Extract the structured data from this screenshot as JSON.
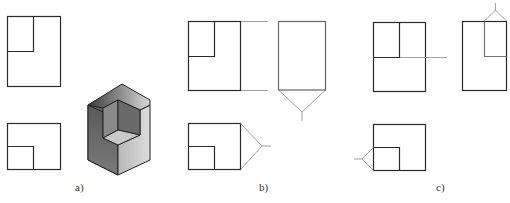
{
  "figure": {
    "panels": [
      {
        "label": "a)",
        "content": "front view, top view, isometric solid with corner notch"
      },
      {
        "label": "b)",
        "content": "front view, top view, derived side view with 45-degree construction lines"
      },
      {
        "label": "c)",
        "content": "projection of notch feature to side view"
      }
    ]
  },
  "colors": {
    "line": "#2a2a2a",
    "construction": "#888888",
    "solid_dark": "#555555",
    "solid_mid": "#888888",
    "solid_light": "#cfcfcf"
  }
}
